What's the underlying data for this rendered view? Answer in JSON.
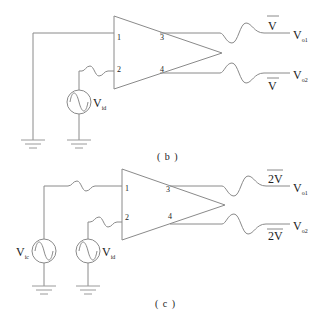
{
  "diagram": {
    "type": "circuit",
    "panels": [
      {
        "caption": "( b )",
        "amplifier": {
          "pins": [
            "1",
            "2",
            "3",
            "4"
          ]
        },
        "sources": [
          {
            "label": "V",
            "subscript": "id"
          }
        ],
        "outputs": [
          {
            "label": "V",
            "subscript": "o1",
            "amplitude": "V"
          },
          {
            "label": "V",
            "subscript": "o2",
            "amplitude": "V"
          }
        ]
      },
      {
        "caption": "( c )",
        "amplifier": {
          "pins": [
            "1",
            "2",
            "3",
            "4"
          ]
        },
        "sources": [
          {
            "label": "V",
            "subscript": "ic"
          },
          {
            "label": "V",
            "subscript": "id"
          }
        ],
        "outputs": [
          {
            "label": "V",
            "subscript": "o1",
            "amplitude": "2V"
          },
          {
            "label": "V",
            "subscript": "o2",
            "amplitude": "2V"
          }
        ]
      }
    ],
    "colors": {
      "wire": "#8a8a8a",
      "text": "#222222",
      "background": "#ffffff"
    }
  }
}
